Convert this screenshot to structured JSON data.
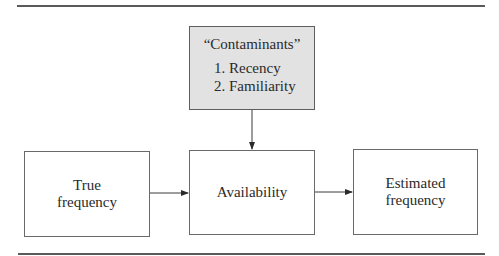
{
  "diagram": {
    "contaminants_box": {
      "title": "“Contaminants”",
      "items": [
        "1. Recency",
        "2. Familiarity"
      ],
      "fill_color": "#e2e2e2"
    },
    "nodes": [
      {
        "id": "true_frequency",
        "line1": "True",
        "line2": "frequency"
      },
      {
        "id": "availability",
        "line1": "Availability"
      },
      {
        "id": "estimated_frequency",
        "line1": "Estimated",
        "line2": "frequency"
      }
    ],
    "edges": [
      {
        "from": "contaminants_box",
        "to": "availability"
      },
      {
        "from": "true_frequency",
        "to": "availability"
      },
      {
        "from": "availability",
        "to": "estimated_frequency"
      }
    ]
  }
}
